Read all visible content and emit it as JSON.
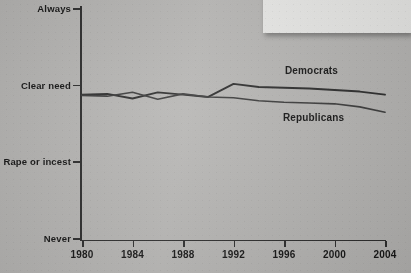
{
  "figure": {
    "callout_text": "obtain an abortion as a choice.",
    "background_color": "#b6b5b3",
    "line_color": "#2b2b2b"
  },
  "chart_data": {
    "type": "line",
    "title": "",
    "xlabel": "",
    "ylabel": "",
    "x": [
      1980,
      1982,
      1984,
      1986,
      1988,
      1990,
      1992,
      1994,
      1996,
      1998,
      2000,
      2002,
      2004
    ],
    "xticks": [
      "1980",
      "1984",
      "1988",
      "1992",
      "1996",
      "2000",
      "2004"
    ],
    "xlim": [
      1980,
      2004
    ],
    "yticks": [
      "Always",
      "Clear need",
      "Rape or incest",
      "Never"
    ],
    "ytick_values": [
      4,
      3,
      2,
      1
    ],
    "ylim": [
      1,
      4
    ],
    "grid": false,
    "legend": "inline-labels",
    "series": [
      {
        "name": "Democrats",
        "label": "Democrats",
        "color": "#2b2b2b",
        "values": [
          2.87,
          2.88,
          2.82,
          2.9,
          2.87,
          2.84,
          3.01,
          2.97,
          2.96,
          2.95,
          2.93,
          2.91,
          2.87
        ]
      },
      {
        "name": "Republicans",
        "label": "Republicans",
        "color": "#3a3a3a",
        "values": [
          2.86,
          2.85,
          2.9,
          2.81,
          2.88,
          2.84,
          2.83,
          2.79,
          2.77,
          2.76,
          2.75,
          2.71,
          2.64
        ]
      }
    ]
  }
}
